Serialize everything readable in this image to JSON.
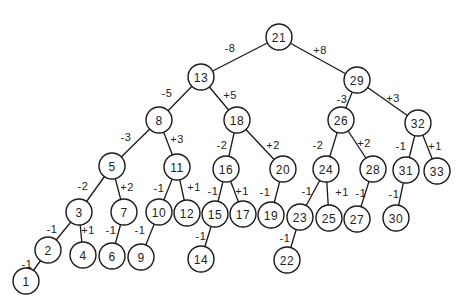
{
  "diagram": {
    "type": "binary-tree",
    "node_radius": 13,
    "colors": {
      "stroke": "#1a1a1a",
      "fill": "#ffffff",
      "text": "#222222",
      "background": "#ffffff"
    },
    "nodes": [
      {
        "id": "21",
        "label": "21",
        "x": 279,
        "y": 37
      },
      {
        "id": "13",
        "label": "13",
        "x": 201,
        "y": 77
      },
      {
        "id": "29",
        "label": "29",
        "x": 357,
        "y": 80
      },
      {
        "id": "8",
        "label": "8",
        "x": 159,
        "y": 120
      },
      {
        "id": "18",
        "label": "18",
        "x": 237,
        "y": 120
      },
      {
        "id": "26",
        "label": "26",
        "x": 341,
        "y": 120
      },
      {
        "id": "32",
        "label": "32",
        "x": 418,
        "y": 123
      },
      {
        "id": "5",
        "label": "5",
        "x": 112,
        "y": 166
      },
      {
        "id": "11",
        "label": "11",
        "x": 177,
        "y": 167
      },
      {
        "id": "16",
        "label": "16",
        "x": 226,
        "y": 169
      },
      {
        "id": "20",
        "label": "20",
        "x": 283,
        "y": 169
      },
      {
        "id": "24",
        "label": "24",
        "x": 326,
        "y": 169
      },
      {
        "id": "28",
        "label": "28",
        "x": 373,
        "y": 169
      },
      {
        "id": "31",
        "label": "31",
        "x": 406,
        "y": 170
      },
      {
        "id": "33",
        "label": "33",
        "x": 437,
        "y": 171
      },
      {
        "id": "3",
        "label": "3",
        "x": 79,
        "y": 212
      },
      {
        "id": "7",
        "label": "7",
        "x": 124,
        "y": 212
      },
      {
        "id": "10",
        "label": "10",
        "x": 159,
        "y": 212
      },
      {
        "id": "12",
        "label": "12",
        "x": 187,
        "y": 213
      },
      {
        "id": "15",
        "label": "15",
        "x": 215,
        "y": 214
      },
      {
        "id": "17",
        "label": "17",
        "x": 243,
        "y": 214
      },
      {
        "id": "19",
        "label": "19",
        "x": 271,
        "y": 215
      },
      {
        "id": "23",
        "label": "23",
        "x": 300,
        "y": 217
      },
      {
        "id": "25",
        "label": "25",
        "x": 329,
        "y": 218
      },
      {
        "id": "27",
        "label": "27",
        "x": 357,
        "y": 219
      },
      {
        "id": "30",
        "label": "30",
        "x": 396,
        "y": 218
      },
      {
        "id": "2",
        "label": "2",
        "x": 48,
        "y": 250
      },
      {
        "id": "4",
        "label": "4",
        "x": 83,
        "y": 255
      },
      {
        "id": "6",
        "label": "6",
        "x": 112,
        "y": 256
      },
      {
        "id": "9",
        "label": "9",
        "x": 141,
        "y": 257
      },
      {
        "id": "14",
        "label": "14",
        "x": 201,
        "y": 259
      },
      {
        "id": "22",
        "label": "22",
        "x": 287,
        "y": 260
      },
      {
        "id": "1",
        "label": "1",
        "x": 26,
        "y": 281
      }
    ],
    "edges": [
      {
        "from": "21",
        "to": "13",
        "label": "-8",
        "lx": 230,
        "ly": 48
      },
      {
        "from": "21",
        "to": "29",
        "label": "+8",
        "lx": 320,
        "ly": 50
      },
      {
        "from": "13",
        "to": "8",
        "label": "-5",
        "lx": 167,
        "ly": 93
      },
      {
        "from": "13",
        "to": "18",
        "label": "+5",
        "lx": 230,
        "ly": 95
      },
      {
        "from": "29",
        "to": "26",
        "label": "-3",
        "lx": 342,
        "ly": 99
      },
      {
        "from": "29",
        "to": "32",
        "label": "+3",
        "lx": 393,
        "ly": 98
      },
      {
        "from": "8",
        "to": "5",
        "label": "-3",
        "lx": 126,
        "ly": 137
      },
      {
        "from": "8",
        "to": "11",
        "label": "+3",
        "lx": 177,
        "ly": 139
      },
      {
        "from": "18",
        "to": "16",
        "label": "-2",
        "lx": 222,
        "ly": 145
      },
      {
        "from": "18",
        "to": "20",
        "label": "+2",
        "lx": 273,
        "ly": 145
      },
      {
        "from": "26",
        "to": "24",
        "label": "-2",
        "lx": 318,
        "ly": 145
      },
      {
        "from": "26",
        "to": "28",
        "label": "+2",
        "lx": 364,
        "ly": 143
      },
      {
        "from": "32",
        "to": "31",
        "label": "-1",
        "lx": 401,
        "ly": 146
      },
      {
        "from": "32",
        "to": "33",
        "label": "+1",
        "lx": 435,
        "ly": 146
      },
      {
        "from": "5",
        "to": "3",
        "label": "-2",
        "lx": 83,
        "ly": 186
      },
      {
        "from": "5",
        "to": "7",
        "label": "+2",
        "lx": 127,
        "ly": 187
      },
      {
        "from": "11",
        "to": "10",
        "label": "-1",
        "lx": 159,
        "ly": 188
      },
      {
        "from": "11",
        "to": "12",
        "label": "+1",
        "lx": 194,
        "ly": 187
      },
      {
        "from": "16",
        "to": "15",
        "label": "-1",
        "lx": 213,
        "ly": 191
      },
      {
        "from": "16",
        "to": "17",
        "label": "+1",
        "lx": 242,
        "ly": 191
      },
      {
        "from": "20",
        "to": "19",
        "label": "-1",
        "lx": 265,
        "ly": 192
      },
      {
        "from": "24",
        "to": "23",
        "label": "-1",
        "lx": 307,
        "ly": 191
      },
      {
        "from": "24",
        "to": "25",
        "label": "+1",
        "lx": 342,
        "ly": 192
      },
      {
        "from": "28",
        "to": "27",
        "label": "-1",
        "lx": 361,
        "ly": 193
      },
      {
        "from": "31",
        "to": "30",
        "label": "-1",
        "lx": 394,
        "ly": 194
      },
      {
        "from": "3",
        "to": "2",
        "label": "-1",
        "lx": 52,
        "ly": 229
      },
      {
        "from": "3",
        "to": "4",
        "label": "+1",
        "lx": 88,
        "ly": 230
      },
      {
        "from": "7",
        "to": "6",
        "label": "-1",
        "lx": 111,
        "ly": 230
      },
      {
        "from": "10",
        "to": "9",
        "label": "-1",
        "lx": 140,
        "ly": 230
      },
      {
        "from": "15",
        "to": "14",
        "label": "-1",
        "lx": 201,
        "ly": 236
      },
      {
        "from": "23",
        "to": "22",
        "label": "-1",
        "lx": 285,
        "ly": 238
      },
      {
        "from": "2",
        "to": "1",
        "label": "-1",
        "lx": 27,
        "ly": 264
      }
    ]
  }
}
